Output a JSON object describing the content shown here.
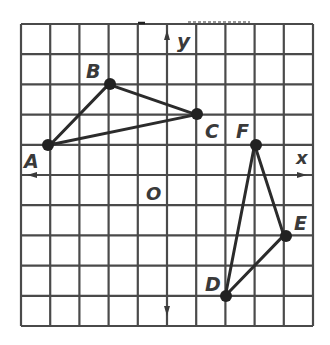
{
  "grid": {
    "x_min": -5,
    "x_max": 5,
    "y_min": -5,
    "y_max": 5,
    "line_color": "#4a4a4a",
    "axis_color": "#3a3a3a"
  },
  "axes": {
    "x_label": "x",
    "y_label": "y",
    "origin_label": "O"
  },
  "triangles": [
    {
      "name": "ABC",
      "points": [
        {
          "label": "A",
          "x": -4,
          "y": 1
        },
        {
          "label": "B",
          "x": -2,
          "y": 3
        },
        {
          "label": "C",
          "x": 1,
          "y": 2
        }
      ]
    },
    {
      "name": "DEF",
      "points": [
        {
          "label": "D",
          "x": 2,
          "y": -4
        },
        {
          "label": "E",
          "x": 4,
          "y": -2
        },
        {
          "label": "F",
          "x": 3,
          "y": 1
        }
      ]
    }
  ],
  "labels": {
    "A": "A",
    "B": "B",
    "C": "C",
    "D": "D",
    "E": "E",
    "F": "F"
  },
  "stroke_color": "#2b2b2b"
}
